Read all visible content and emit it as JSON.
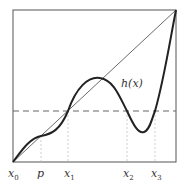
{
  "diagram": {
    "curve_label": "h(x)",
    "x_labels": [
      {
        "name": "x",
        "sub": "0"
      },
      {
        "name": "p",
        "sub": ""
      },
      {
        "name": "x",
        "sub": "1"
      },
      {
        "name": "x",
        "sub": "2"
      },
      {
        "name": "x",
        "sub": "3"
      }
    ],
    "colors": {
      "curve": "#222222",
      "diagonal": "#444444",
      "frame": "#555555",
      "dashed": "#666666",
      "guides": "#bbbbbb"
    }
  }
}
